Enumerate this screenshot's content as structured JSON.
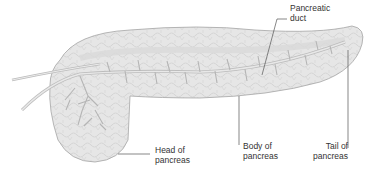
{
  "diagram": {
    "labels": {
      "pancreatic_duct": {
        "line1": "Pancreatic",
        "line2": "duct"
      },
      "head": {
        "line1": "Head of",
        "line2": "pancreas"
      },
      "body": {
        "line1": "Body of",
        "line2": "pancreas"
      },
      "tail": {
        "line1": "Tail of",
        "line2": "pancreas"
      }
    },
    "colors": {
      "tissue_fill": "#e4e4e4",
      "tissue_stroke": "#9a9a9a",
      "duct": "#c8c8c8",
      "leader_line": "#555555",
      "text": "#333333"
    }
  }
}
